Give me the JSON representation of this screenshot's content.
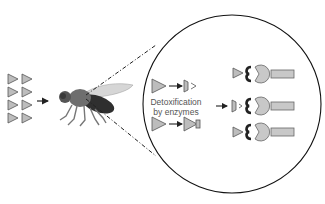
{
  "diagram": {
    "label_line1": "Detoxification",
    "label_line2": "by enzymes",
    "colors": {
      "triangle_fill": "#bdbdbd",
      "triangle_stroke": "#555555",
      "receptor_fill": "#c8c8c8",
      "receptor_stroke": "#666666",
      "hook": "#222222",
      "fly_body": "#6e6e6e",
      "fly_abdomen": "#2f2f2f",
      "wing": "#d6d6d6",
      "circle_stroke": "#111111",
      "arrow": "#222222"
    },
    "elements": {
      "insecticide_molecules": {
        "count": 8,
        "columns": 2,
        "rows": 4
      },
      "fly": "fruit-fly",
      "magnified_circle": "zoom-in-cell",
      "detox_pairs": [
        {
          "input": "intact-molecule",
          "output": "cleaved-molecule"
        },
        {
          "input": "intact-molecule",
          "output": "conjugated-molecule"
        }
      ],
      "receptors": [
        {
          "ligand": "intact-molecule"
        },
        {
          "ligand": "cleaved-molecule"
        },
        {
          "ligand": "intact-molecule"
        }
      ]
    }
  }
}
